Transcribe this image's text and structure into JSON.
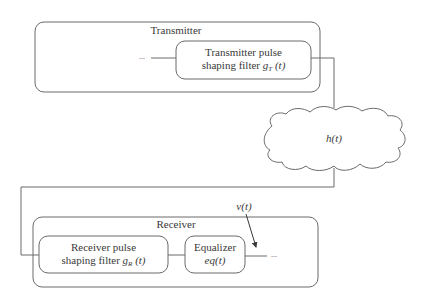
{
  "diagram": {
    "type": "block-diagram",
    "transmitter": {
      "title": "Transmitter",
      "input_ellipsis": "...",
      "filter": {
        "line1": "Transmitter pulse",
        "line2_prefix": "shaping filter ",
        "symbol": "g",
        "subscript": "T",
        "arg": " (t)"
      }
    },
    "channel": {
      "label": "h(t)",
      "shape": "cloud"
    },
    "noise": {
      "label": "v(t)"
    },
    "receiver": {
      "title": "Receiver",
      "filter": {
        "line1": "Receiver pulse",
        "line2_prefix": "shaping filter ",
        "symbol": "g",
        "subscript": "R",
        "arg": " (t)"
      },
      "equalizer": {
        "line1": "Equalizer",
        "line2": "eq(t)"
      },
      "output_ellipsis": "..."
    },
    "colors": {
      "stroke": "#6a6a6a",
      "text": "#3a3a3a",
      "background": "#ffffff"
    }
  }
}
